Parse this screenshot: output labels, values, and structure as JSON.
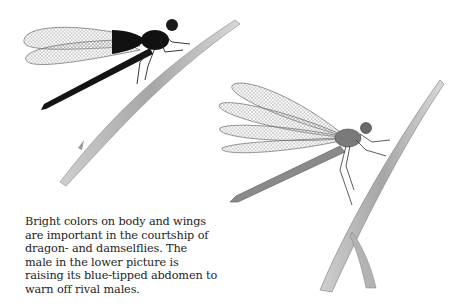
{
  "figures": [
    {
      "id": "upper",
      "label": "Damselfly with dark body and dark-tipped wings perched on grass stem",
      "colors": {
        "body": "#111111",
        "wing": "#bcbcbc",
        "stem": "#9a9a9a"
      }
    },
    {
      "id": "lower",
      "label": "Male damselfly raising blue-tipped abdomen on reed stem",
      "colors": {
        "body": "#6e6e6e",
        "wing": "#a8a8a8",
        "stem": "#8c8c8c"
      }
    }
  ],
  "caption": {
    "lines": [
      "Bright colors on body and wings",
      "are important in the courtship of",
      "dragon- and damselflies. The",
      "male in the lower picture is",
      "raising its blue-tipped abdomen to",
      "warn off rival males."
    ]
  }
}
